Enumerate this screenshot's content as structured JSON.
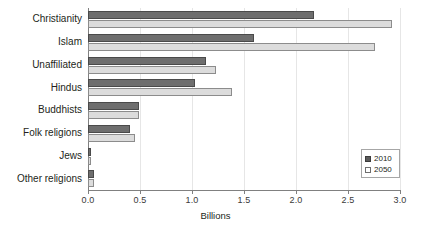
{
  "chart_data": {
    "type": "bar",
    "orientation": "horizontal",
    "title": "",
    "xlabel": "Billions",
    "ylabel": "",
    "xlim": [
      0.0,
      3.0
    ],
    "xticks": [
      "0.0",
      "0.5",
      "1.0",
      "1.5",
      "2.0",
      "2.5",
      "3.0"
    ],
    "xtick_values": [
      0.0,
      0.5,
      1.0,
      1.5,
      2.0,
      2.5,
      3.0
    ],
    "grid": "vertical",
    "legend_position": "bottom-right",
    "categories": [
      "Christianity",
      "Islam",
      "Unaffiliated",
      "Hindus",
      "Buddhists",
      "Folk religions",
      "Jews",
      "Other religions"
    ],
    "series": [
      {
        "name": "2010",
        "color": "#6e6e6e",
        "values": [
          2.17,
          1.6,
          1.13,
          1.03,
          0.49,
          0.4,
          0.01,
          0.06
        ]
      },
      {
        "name": "2050",
        "color": "#dcdcdc",
        "values": [
          2.92,
          2.76,
          1.23,
          1.38,
          0.49,
          0.45,
          0.02,
          0.06
        ]
      }
    ]
  },
  "legend": {
    "items": [
      {
        "label": "2010",
        "swatch": "filled-dark-square"
      },
      {
        "label": "2050",
        "swatch": "empty-light-square"
      }
    ]
  },
  "colors": {
    "series_2010": "#6e6e6e",
    "series_2050": "#dcdcdc",
    "axis": "#808080",
    "grid": "#e6e6e6",
    "text": "#231f20",
    "background": "#ffffff"
  }
}
